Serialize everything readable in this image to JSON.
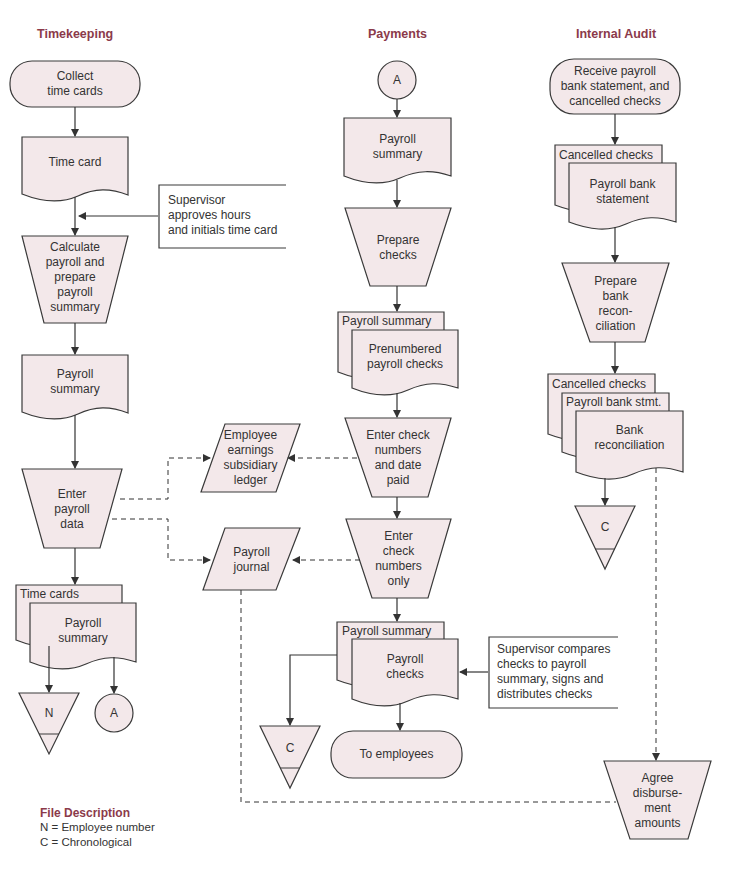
{
  "lanes": {
    "timekeeping": "Timekeeping",
    "payments": "Payments",
    "internal_audit": "Internal Audit"
  },
  "timekeeping": {
    "start": "Collect\ntime cards",
    "doc_time_card": "Time card",
    "annotation_supervisor": "Supervisor\napproves hours\nand initials time card",
    "process_calculate": "Calculate\npayroll and\nprepare\npayroll\nsummary",
    "doc_payroll_summary": "Payroll\nsummary",
    "process_enter_payroll": "Enter\npayroll\ndata",
    "doc_time_cards": "Time cards",
    "doc_payroll_summary_2": "Payroll\nsummary",
    "file_n": "N",
    "connector_a": "A"
  },
  "ledgers": {
    "employee_earnings": "Employee\nearnings\nsubsidiary\nledger",
    "payroll_journal": "Payroll\njournal"
  },
  "payments": {
    "connector_a": "A",
    "doc_payroll_summary": "Payroll\nsummary",
    "process_prepare_checks": "Prepare\nchecks",
    "doc_payroll_summary_back": "Payroll summary",
    "doc_prenumbered_checks": "Prenumbered\npayroll checks",
    "process_enter_check_date": "Enter check\nnumbers\nand date\npaid",
    "process_enter_check_only": "Enter\ncheck\nnumbers\nonly",
    "doc_payroll_summary_back_2": "Payroll summary",
    "doc_payroll_checks": "Payroll\nchecks",
    "annotation_supervisor": "Supervisor compares\nchecks to payroll\nsummary, signs and\ndistributes checks",
    "file_c": "C",
    "terminal_employees": "To employees"
  },
  "audit": {
    "start": "Receive payroll\nbank statement, and\ncancelled checks",
    "doc_cancelled_checks": "Cancelled checks",
    "doc_bank_statement": "Payroll bank\nstatement",
    "process_prepare_recon": "Prepare\nbank\nrecon-\nciliation",
    "doc_cancelled_checks_2": "Cancelled checks",
    "doc_bank_stmt_2": "Payroll bank stmt.",
    "doc_bank_recon": "Bank\nreconciliation",
    "file_c": "C",
    "process_agree": "Agree\ndisburse-\nment\namounts"
  },
  "legend": {
    "title": "File Description",
    "items": [
      "N = Employee number",
      "C = Chronological"
    ]
  },
  "colors": {
    "shape_fill": "#f3e8ea",
    "stroke": "#3a3a3a",
    "heading": "#8b3a4a"
  }
}
